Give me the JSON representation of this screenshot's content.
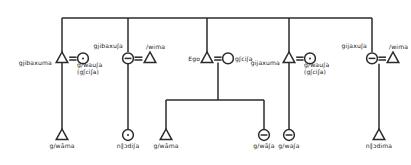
{
  "diagram": {
    "kind": "kinship-chart",
    "title": "",
    "symbols": {
      "male": "triangle",
      "female": "circle",
      "female-dotted": "circle-with-dot",
      "female-barred": "circle-with-bar",
      "marriage": "equals-sign",
      "descent": "vertical-line",
      "sibling-bar": "horizontal-line"
    },
    "colors": {
      "ink": "#1a1a1a",
      "background": "#ffffff",
      "line": "#2b2b2b"
    },
    "generation1": {
      "sibling_bar_label": "",
      "units": [
        {
          "id": "unit-1",
          "male_label": "gjibaxuma",
          "female_label": "g/wauʃa",
          "female_label_alt": "(gʃciʃa)",
          "male_symbol": "triangle",
          "female_symbol": "circle-with-dot",
          "marriage": "="
        },
        {
          "id": "unit-2",
          "female_label": "gjibaxuʃa",
          "male_label": "/wima",
          "female_symbol": "circle-with-bar",
          "male_symbol": "triangle",
          "marriage": "="
        },
        {
          "id": "unit-3",
          "male_label": "Ego",
          "female_label": "gʃciʃa",
          "male_symbol": "triangle",
          "female_symbol": "circle",
          "marriage": "="
        },
        {
          "id": "unit-4",
          "male_label": "gijaxuma",
          "female_label": "g/wauʃa",
          "female_label_alt": "(gʃciʃa)",
          "male_symbol": "triangle",
          "female_symbol": "circle-with-dot",
          "marriage": "="
        },
        {
          "id": "unit-5",
          "female_label": "gijaxuʃa",
          "male_label": "/wima",
          "female_symbol": "circle-with-bar",
          "male_symbol": "triangle",
          "marriage": "="
        }
      ]
    },
    "generation2": {
      "children": [
        {
          "id": "child-1",
          "label": "g/wāma",
          "symbol": "triangle"
        },
        {
          "id": "child-2",
          "label": "n∥ɔdiʃa",
          "symbol": "circle-with-dot"
        },
        {
          "id": "child-3",
          "label": "g/wāma",
          "symbol": "triangle"
        },
        {
          "id": "child-4",
          "label": "g/wãʃa",
          "symbol": "circle-with-bar"
        },
        {
          "id": "child-5",
          "label": "g/waʃa",
          "symbol": "circle-with-bar"
        },
        {
          "id": "child-6",
          "label": "n∥ɔdima",
          "symbol": "triangle"
        }
      ]
    }
  }
}
